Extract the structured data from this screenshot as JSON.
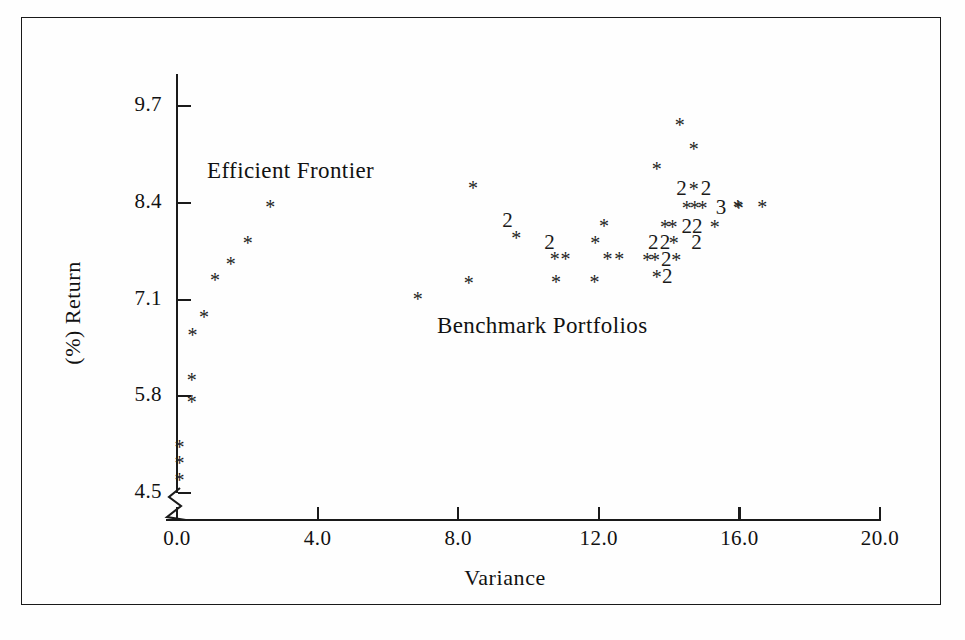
{
  "chart_data": {
    "type": "scatter",
    "title": "",
    "xlabel": "Variance",
    "ylabel": "(%) Return",
    "xlim": [
      -0.6,
      21.5
    ],
    "ylim": [
      4.5,
      10.1
    ],
    "grid": false,
    "legend": "none",
    "xticks": [
      "0.0",
      "4.0",
      "8.0",
      "12.0",
      "16.0",
      "20.0"
    ],
    "xtick_values": [
      0.0,
      4.0,
      8.0,
      12.0,
      16.0,
      20.0
    ],
    "yticks": [
      "4.5",
      "5.8",
      "7.1",
      "8.4",
      "9.7"
    ],
    "ytick_values": [
      4.5,
      5.8,
      7.1,
      8.4,
      9.7
    ],
    "y_axis_break": true,
    "annotations": [
      {
        "name": "efficient-frontier-label",
        "text": "Efficient Frontier",
        "x": 0.9,
        "y": 9.15
      },
      {
        "name": "benchmark-portfolios-label",
        "text": "Benchmark Portfolios",
        "x": 7.5,
        "y": 6.75
      }
    ],
    "marker_glyphs": {
      "single": "*",
      "double": "2",
      "triple": "3"
    },
    "series": [
      {
        "name": "Efficient Frontier",
        "marker": "*",
        "points": [
          {
            "x": 0.07,
            "y": 4.68,
            "label": "*"
          },
          {
            "x": 0.07,
            "y": 4.9,
            "label": "*"
          },
          {
            "x": 0.07,
            "y": 5.12,
            "label": "*"
          },
          {
            "x": 0.42,
            "y": 5.72,
            "label": "*"
          },
          {
            "x": 0.42,
            "y": 6.02,
            "label": "*"
          },
          {
            "x": 0.44,
            "y": 6.62,
            "label": "*"
          },
          {
            "x": 0.77,
            "y": 6.87,
            "label": "*"
          },
          {
            "x": 1.08,
            "y": 7.36,
            "label": "*"
          },
          {
            "x": 1.53,
            "y": 7.58,
            "label": "*"
          },
          {
            "x": 2.01,
            "y": 7.86,
            "label": "*"
          },
          {
            "x": 2.65,
            "y": 8.34,
            "label": "*"
          }
        ]
      },
      {
        "name": "Benchmark Portfolios",
        "marker": "*",
        "points": [
          {
            "x": 6.85,
            "y": 7.11,
            "label": "*"
          },
          {
            "x": 8.3,
            "y": 7.32,
            "label": "*"
          },
          {
            "x": 8.42,
            "y": 8.6,
            "label": "*"
          },
          {
            "x": 9.4,
            "y": 8.15,
            "label": "2"
          },
          {
            "x": 9.65,
            "y": 7.92,
            "label": "*"
          },
          {
            "x": 10.6,
            "y": 7.86,
            "label": "2"
          },
          {
            "x": 10.75,
            "y": 7.65,
            "label": "*"
          },
          {
            "x": 11.05,
            "y": 7.65,
            "label": "*"
          },
          {
            "x": 10.78,
            "y": 7.33,
            "label": "*"
          },
          {
            "x": 12.15,
            "y": 8.09,
            "label": "*"
          },
          {
            "x": 11.9,
            "y": 7.86,
            "label": "*"
          },
          {
            "x": 12.25,
            "y": 7.65,
            "label": "*"
          },
          {
            "x": 12.58,
            "y": 7.65,
            "label": "*"
          },
          {
            "x": 11.88,
            "y": 7.34,
            "label": "*"
          },
          {
            "x": 14.3,
            "y": 9.45,
            "label": "*"
          },
          {
            "x": 14.7,
            "y": 9.12,
            "label": "*"
          },
          {
            "x": 13.65,
            "y": 8.86,
            "label": "*"
          },
          {
            "x": 14.35,
            "y": 8.58,
            "label": "2"
          },
          {
            "x": 14.7,
            "y": 8.58,
            "label": "*"
          },
          {
            "x": 15.05,
            "y": 8.58,
            "label": "2"
          },
          {
            "x": 14.5,
            "y": 8.33,
            "label": "*"
          },
          {
            "x": 14.73,
            "y": 8.33,
            "label": "*"
          },
          {
            "x": 14.95,
            "y": 8.33,
            "label": "*"
          },
          {
            "x": 15.48,
            "y": 8.33,
            "label": "3"
          },
          {
            "x": 15.98,
            "y": 8.33,
            "label": "*"
          },
          {
            "x": 13.88,
            "y": 8.08,
            "label": "*"
          },
          {
            "x": 14.1,
            "y": 8.08,
            "label": "*"
          },
          {
            "x": 14.5,
            "y": 8.08,
            "label": "2"
          },
          {
            "x": 14.8,
            "y": 8.08,
            "label": "2"
          },
          {
            "x": 15.3,
            "y": 8.08,
            "label": "*"
          },
          {
            "x": 13.55,
            "y": 7.86,
            "label": "2"
          },
          {
            "x": 13.88,
            "y": 7.86,
            "label": "2"
          },
          {
            "x": 14.13,
            "y": 7.86,
            "label": "*"
          },
          {
            "x": 14.78,
            "y": 7.86,
            "label": "2"
          },
          {
            "x": 13.38,
            "y": 7.63,
            "label": "*"
          },
          {
            "x": 13.6,
            "y": 7.63,
            "label": "*"
          },
          {
            "x": 13.92,
            "y": 7.63,
            "label": "2"
          },
          {
            "x": 14.2,
            "y": 7.63,
            "label": "*"
          },
          {
            "x": 13.65,
            "y": 7.4,
            "label": "*"
          },
          {
            "x": 13.95,
            "y": 7.4,
            "label": "2"
          },
          {
            "x": 15.95,
            "y": 8.34,
            "label": "*"
          },
          {
            "x": 16.65,
            "y": 8.34,
            "label": "*"
          }
        ]
      }
    ]
  },
  "axes": {
    "y_title": "(%) Return",
    "x_title": "Variance"
  }
}
